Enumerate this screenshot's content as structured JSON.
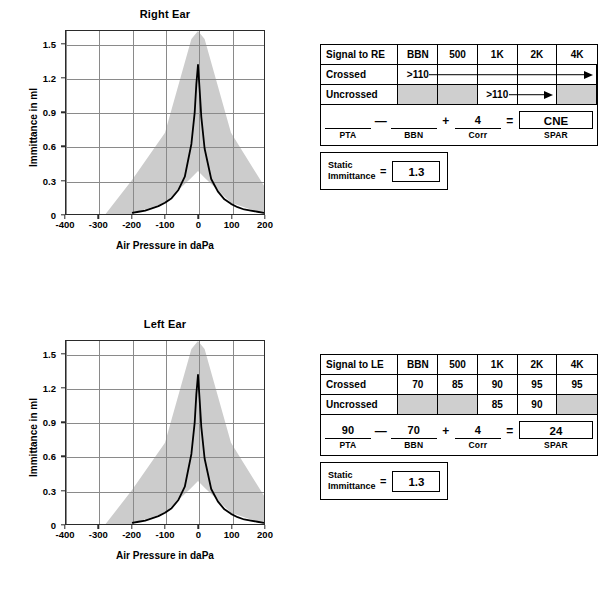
{
  "charts": [
    {
      "title": "Right Ear",
      "xlabel": "Air Pressure in daPa",
      "ylabel": "Immittance in ml",
      "yticks": [
        "0",
        "0.3",
        "0.6",
        "0.9",
        "1.2",
        "1.5"
      ],
      "xticks": [
        "-400",
        "-300",
        "-200",
        "-100",
        "0",
        "100",
        "200"
      ]
    },
    {
      "title": "Left Ear",
      "xlabel": "Air Pressure in daPa",
      "ylabel": "Immittance in ml",
      "yticks": [
        "0",
        "0.3",
        "0.6",
        "0.9",
        "1.2",
        "1.5"
      ],
      "xticks": [
        "-400",
        "-300",
        "-200",
        "-100",
        "0",
        "100",
        "200"
      ]
    }
  ],
  "chart_data": [
    {
      "type": "line",
      "title": "Right Ear",
      "xlabel": "Air Pressure in daPa",
      "ylabel": "Immittance in ml",
      "xlim": [
        -400,
        200
      ],
      "ylim": [
        0,
        1.62
      ],
      "xticks": [
        -400,
        -300,
        -200,
        -100,
        0,
        100,
        200
      ],
      "yticks": [
        0,
        0.3,
        0.6,
        0.9,
        1.2,
        1.5
      ],
      "grid": true,
      "legend": "none",
      "series": [
        {
          "name": "Tympanogram",
          "x": [
            -200,
            -180,
            -160,
            -140,
            -120,
            -100,
            -80,
            -60,
            -40,
            -20,
            -10,
            -5,
            0,
            5,
            10,
            20,
            40,
            60,
            80,
            100,
            120,
            140,
            160,
            180,
            200
          ],
          "y": [
            0.01,
            0.02,
            0.03,
            0.05,
            0.07,
            0.1,
            0.14,
            0.21,
            0.33,
            0.62,
            0.9,
            1.15,
            1.32,
            1.1,
            0.86,
            0.58,
            0.31,
            0.2,
            0.13,
            0.09,
            0.06,
            0.04,
            0.03,
            0.02,
            0.01
          ]
        }
      ],
      "normative_band": {
        "name": "Normal range (shaded)",
        "upper_x": [
          -400,
          -280,
          -200,
          -100,
          -20,
          0,
          20,
          100,
          200
        ],
        "upper_y": [
          0.0,
          0.0,
          0.3,
          0.72,
          1.55,
          1.62,
          1.55,
          0.72,
          0.25
        ],
        "lower_x": [
          -400,
          -280,
          -200,
          -100,
          -20,
          0,
          20,
          100,
          200
        ],
        "lower_y": [
          0.0,
          0.0,
          0.0,
          0.1,
          0.32,
          0.38,
          0.32,
          0.1,
          0.0
        ],
        "color": "#cccccc"
      }
    },
    {
      "type": "line",
      "title": "Left Ear",
      "xlabel": "Air Pressure in daPa",
      "ylabel": "Immittance in ml",
      "xlim": [
        -400,
        200
      ],
      "ylim": [
        0,
        1.62
      ],
      "xticks": [
        -400,
        -300,
        -200,
        -100,
        0,
        100,
        200
      ],
      "yticks": [
        0,
        0.3,
        0.6,
        0.9,
        1.2,
        1.5
      ],
      "grid": true,
      "legend": "none",
      "series": [
        {
          "name": "Tympanogram",
          "x": [
            -200,
            -180,
            -160,
            -140,
            -120,
            -100,
            -80,
            -60,
            -40,
            -20,
            -10,
            -5,
            0,
            5,
            10,
            20,
            40,
            60,
            80,
            100,
            120,
            140,
            160,
            180,
            200
          ],
          "y": [
            0.01,
            0.02,
            0.03,
            0.05,
            0.07,
            0.1,
            0.14,
            0.21,
            0.33,
            0.62,
            0.9,
            1.15,
            1.32,
            1.1,
            0.86,
            0.58,
            0.31,
            0.2,
            0.13,
            0.09,
            0.06,
            0.04,
            0.03,
            0.02,
            0.01
          ]
        }
      ],
      "normative_band": {
        "name": "Normal range (shaded)",
        "upper_x": [
          -400,
          -280,
          -200,
          -100,
          -20,
          0,
          20,
          100,
          200
        ],
        "upper_y": [
          0.0,
          0.0,
          0.3,
          0.72,
          1.55,
          1.62,
          1.55,
          0.72,
          0.25
        ],
        "lower_x": [
          -400,
          -280,
          -200,
          -100,
          -20,
          0,
          20,
          100,
          200
        ],
        "lower_y": [
          0.0,
          0.0,
          0.0,
          0.1,
          0.32,
          0.38,
          0.32,
          0.1,
          0.0
        ],
        "color": "#cccccc"
      }
    }
  ],
  "reflex_tables": [
    {
      "id": "right",
      "signal_label": "Signal to RE",
      "frequencies": [
        "BBN",
        "500",
        "1K",
        "2K",
        "4K"
      ],
      "rows": [
        {
          "label": "Crossed",
          "values": [
            ">110",
            "",
            "",
            "",
            ""
          ],
          "shaded": [
            false,
            false,
            false,
            false,
            false
          ],
          "arrow": {
            "from": 0,
            "to": 4
          }
        },
        {
          "label": "Uncrossed",
          "values": [
            "",
            "",
            ">110",
            "",
            ""
          ],
          "shaded": [
            true,
            true,
            false,
            false,
            true
          ],
          "arrow": {
            "from": 2,
            "to": 3
          }
        }
      ],
      "spar": {
        "pta_value": "",
        "pta_caption": "PTA",
        "op1": "—",
        "bbn_value": "",
        "bbn_caption": "BBN",
        "op2": "+",
        "corr_value": "4",
        "corr_caption": "Corr",
        "op3": "=",
        "result_value": "CNE",
        "result_caption": "SPAR"
      }
    },
    {
      "id": "left",
      "signal_label": "Signal to LE",
      "frequencies": [
        "BBN",
        "500",
        "1K",
        "2K",
        "4K"
      ],
      "rows": [
        {
          "label": "Crossed",
          "values": [
            "70",
            "85",
            "90",
            "95",
            "95"
          ],
          "shaded": [
            false,
            false,
            false,
            false,
            false
          ],
          "arrow": null
        },
        {
          "label": "Uncrossed",
          "values": [
            "",
            "",
            "85",
            "90",
            ""
          ],
          "shaded": [
            true,
            true,
            false,
            false,
            true
          ],
          "arrow": null
        }
      ],
      "spar": {
        "pta_value": "90",
        "pta_caption": "PTA",
        "op1": "—",
        "bbn_value": "70",
        "bbn_caption": "BBN",
        "op2": "+",
        "corr_value": "4",
        "corr_caption": "Corr",
        "op3": "=",
        "result_value": "24",
        "result_caption": "SPAR"
      }
    }
  ],
  "static_immittance": [
    {
      "id": "right",
      "label_line1": "Static",
      "label_line2": "Immittance",
      "equals": "=",
      "value": "1.3"
    },
    {
      "id": "left",
      "label_line1": "Static",
      "label_line2": "Immittance",
      "equals": "=",
      "value": "1.3"
    }
  ],
  "colors": {
    "band": "#cccccc",
    "curve": "#000000",
    "grid": "#8a8a8a",
    "frame": "#2b2b2b",
    "table_shade": "#cfcfcf"
  }
}
